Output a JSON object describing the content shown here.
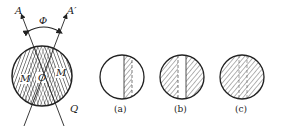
{
  "main_figure": {
    "axis_labels": {
      "left": "A",
      "right": "A′",
      "bottom_right": "Q"
    },
    "angle_label": "Φ",
    "center_label": "O",
    "region_labels": {
      "left": "M",
      "right": "M"
    }
  },
  "subfigures": [
    {
      "id": "a",
      "caption": "(a)",
      "description": "narrow hatched vertical stripe in clear circle"
    },
    {
      "id": "b",
      "caption": "(b)",
      "description": "hatched circle with clear vertical stripe"
    },
    {
      "id": "c",
      "caption": "(c)",
      "description": "fully hatched circle with faint stripe boundaries"
    }
  ],
  "colors": {
    "stroke": "#222222",
    "hatch": "#444444",
    "background": "#ffffff"
  }
}
